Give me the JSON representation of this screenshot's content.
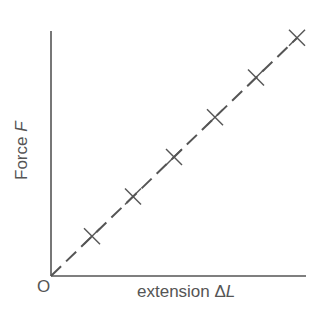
{
  "chart_data": {
    "type": "scatter",
    "title": "",
    "xlabel": "extension ΔL",
    "ylabel": "Force F",
    "origin_label": "O",
    "grid": false,
    "legend": null,
    "marker": "x",
    "fit_line": {
      "style": "dashed",
      "through_origin": true
    },
    "x": [
      1,
      2,
      3,
      4,
      5,
      6
    ],
    "y": [
      1,
      2,
      3,
      4,
      5,
      6
    ],
    "xlim": [
      0,
      6.2
    ],
    "ylim": [
      0,
      6.2
    ],
    "annotations": []
  },
  "labels": {
    "y_prefix": "Force ",
    "y_var": "F",
    "x_prefix": "extension Δ",
    "x_var": "L",
    "origin": "O"
  },
  "colors": {
    "axis": "#555555",
    "marker": "#555555",
    "line": "#555555",
    "background": "#ffffff"
  }
}
